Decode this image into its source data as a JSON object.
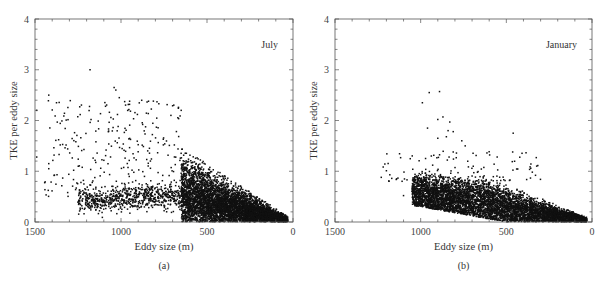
{
  "chart_data": [
    {
      "type": "scatter",
      "panel_label": "(a)",
      "annotation": "July",
      "annotation_position": "top-right",
      "xlabel": "Eddy size (m)",
      "ylabel": "TKE per eddy size",
      "xlim": [
        1500,
        0
      ],
      "ylim": [
        0,
        4
      ],
      "x_inverted": true,
      "xticks": [
        1500,
        1000,
        500,
        0
      ],
      "yticks": [
        0,
        1,
        2,
        3,
        4
      ],
      "x_minor_step": 100,
      "y_minor_step": 0.2,
      "grid": false,
      "marker_color": "#111111",
      "series": [
        {
          "name": "July eddies",
          "description": "dense cloud concentrated 0-650 m, TKE decreasing toward 0 at 0 m; sparse scatter up to ~3 for 700-1450 m",
          "dense_region": {
            "x_range": [
              30,
              650
            ],
            "peak_tke_at_650": 1.5,
            "count": 5000
          },
          "band_region": {
            "x_range": [
              650,
              1250
            ],
            "tke_center": 0.5,
            "count": 700
          },
          "sparse_region": {
            "x_range": [
              650,
              1450
            ],
            "tke_range": [
              0.5,
              2.4
            ],
            "count": 260
          },
          "outliers": [
            {
              "x": 1180,
              "y": 3.0
            },
            {
              "x": 1420,
              "y": 2.5
            },
            {
              "x": 1375,
              "y": 2.35
            },
            {
              "x": 1490,
              "y": 2.2
            },
            {
              "x": 1040,
              "y": 2.65
            },
            {
              "x": 1030,
              "y": 2.6
            },
            {
              "x": 1010,
              "y": 2.45
            },
            {
              "x": 1240,
              "y": 2.27
            },
            {
              "x": 1090,
              "y": 2.28
            },
            {
              "x": 950,
              "y": 2.38
            },
            {
              "x": 840,
              "y": 2.38
            },
            {
              "x": 780,
              "y": 2.33
            },
            {
              "x": 700,
              "y": 2.29
            },
            {
              "x": 650,
              "y": 2.2
            },
            {
              "x": 1420,
              "y": 1.15
            },
            {
              "x": 1420,
              "y": 1.05
            },
            {
              "x": 1360,
              "y": 1.33
            },
            {
              "x": 1310,
              "y": 1.44
            },
            {
              "x": 1270,
              "y": 1.76
            },
            {
              "x": 1310,
              "y": 0.58
            },
            {
              "x": 1490,
              "y": 1.28
            }
          ]
        }
      ]
    },
    {
      "type": "scatter",
      "panel_label": "(b)",
      "annotation": "January",
      "annotation_position": "top-right",
      "xlabel": "Eddy size (m)",
      "ylabel": "TKE per eddy size",
      "xlim": [
        1500,
        0
      ],
      "ylim": [
        0,
        4
      ],
      "x_inverted": true,
      "xticks": [
        1500,
        1000,
        500,
        0
      ],
      "yticks": [
        0,
        1,
        2,
        3,
        4
      ],
      "x_minor_step": 100,
      "y_minor_step": 0.2,
      "grid": false,
      "marker_color": "#111111",
      "series": [
        {
          "name": "January eddies",
          "description": "dense cloud 30-1050 m with TKE mostly below 1, decreasing toward 0 at 0 m; few outliers up to ~2.6",
          "dense_region": {
            "x_range": [
              30,
              1050
            ],
            "peak_tke": 0.9,
            "count": 5500
          },
          "sparse_region": {
            "x_range": [
              300,
              1230
            ],
            "tke_range": [
              0.8,
              1.4
            ],
            "count": 120
          },
          "outliers": [
            {
              "x": 950,
              "y": 2.55
            },
            {
              "x": 890,
              "y": 2.57
            },
            {
              "x": 990,
              "y": 2.35
            },
            {
              "x": 870,
              "y": 2.07
            },
            {
              "x": 900,
              "y": 2.02
            },
            {
              "x": 960,
              "y": 1.85
            },
            {
              "x": 830,
              "y": 1.97
            },
            {
              "x": 840,
              "y": 1.8
            },
            {
              "x": 810,
              "y": 1.78
            },
            {
              "x": 900,
              "y": 1.65
            },
            {
              "x": 850,
              "y": 1.68
            },
            {
              "x": 760,
              "y": 1.6
            },
            {
              "x": 740,
              "y": 1.5
            },
            {
              "x": 810,
              "y": 1.38
            },
            {
              "x": 460,
              "y": 1.75
            },
            {
              "x": 1230,
              "y": 0.88
            },
            {
              "x": 1200,
              "y": 1.01
            },
            {
              "x": 1180,
              "y": 0.93
            },
            {
              "x": 1140,
              "y": 0.85
            },
            {
              "x": 1100,
              "y": 0.52
            },
            {
              "x": 930,
              "y": 1.12
            }
          ]
        }
      ]
    }
  ]
}
